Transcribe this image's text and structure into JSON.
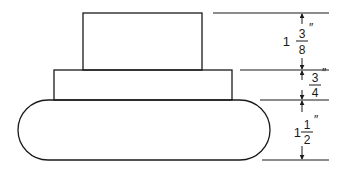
{
  "diagram": {
    "type": "stacked-shapes-with-dimensions",
    "shapes": [
      {
        "id": "top-block",
        "shape": "rectangle"
      },
      {
        "id": "middle-block",
        "shape": "rectangle"
      },
      {
        "id": "base-block",
        "shape": "rounded-rectangle"
      }
    ],
    "dimensions": [
      {
        "id": "top",
        "whole": "1",
        "numerator": "3",
        "denominator": "8",
        "unit": "″",
        "value": "1 3/8\""
      },
      {
        "id": "middle",
        "whole": "",
        "numerator": "3",
        "denominator": "4",
        "unit": "″",
        "value": "3/4\""
      },
      {
        "id": "bottom",
        "whole": "1",
        "numerator": "1",
        "denominator": "2",
        "unit": "″",
        "value": "1 1/2\""
      }
    ]
  }
}
